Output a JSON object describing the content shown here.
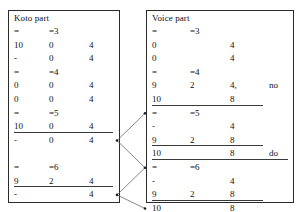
{
  "figure": {
    "left_panel": {
      "title": "Koto part",
      "rows": [
        {
          "cells": [
            "=",
            "=3",
            "",
            ""
          ],
          "underline": "none"
        },
        {
          "cells": [
            "10",
            "0",
            "4",
            ""
          ],
          "underline": "none"
        },
        {
          "cells": [
            "-",
            "0",
            "4",
            ""
          ],
          "underline": "none"
        },
        {
          "cells": [
            "=",
            "=4",
            "",
            ""
          ],
          "underline": "none"
        },
        {
          "cells": [
            "0",
            "0",
            "4",
            ""
          ],
          "underline": "none"
        },
        {
          "cells": [
            "0",
            "0",
            "4",
            ""
          ],
          "underline": "none"
        },
        {
          "cells": [
            "=",
            "=5",
            "",
            ""
          ],
          "underline": "none"
        },
        {
          "cells": [
            "10",
            "0",
            "4",
            ""
          ],
          "underline": "full"
        },
        {
          "cells": [
            "-",
            "0",
            "4",
            ""
          ],
          "underline": "none"
        },
        {
          "cells": [
            "",
            "",
            "",
            ""
          ],
          "underline": "none"
        },
        {
          "cells": [
            "=",
            "=6",
            "",
            ""
          ],
          "underline": "none"
        },
        {
          "cells": [
            "9",
            "2",
            "4",
            ""
          ],
          "underline": "full"
        },
        {
          "cells": [
            "-",
            "",
            "4",
            ""
          ],
          "underline": "none"
        },
        {
          "cells": [
            "",
            "",
            "",
            ""
          ],
          "underline": "none"
        },
        {
          "cells": [
            "=",
            "=7",
            "",
            ""
          ],
          "underline": "none"
        }
      ]
    },
    "right_panel": {
      "title": "Voice part",
      "rows": [
        {
          "cells": [
            "=",
            "=3",
            "",
            ""
          ],
          "underline": "none"
        },
        {
          "cells": [
            "0",
            "",
            "4",
            ""
          ],
          "underline": "none"
        },
        {
          "cells": [
            "0",
            "",
            "4",
            ""
          ],
          "underline": "none"
        },
        {
          "cells": [
            "=",
            "=4",
            "",
            ""
          ],
          "underline": "none"
        },
        {
          "cells": [
            "9",
            "2",
            "4,",
            "no"
          ],
          "underline": "none"
        },
        {
          "cells": [
            "10",
            "",
            "8",
            ""
          ],
          "underline": "short"
        },
        {
          "cells": [
            "=",
            "=5",
            "",
            ""
          ],
          "underline": "none"
        },
        {
          "cells": [
            "-",
            "",
            "4",
            ""
          ],
          "underline": "none"
        },
        {
          "cells": [
            "9",
            "2",
            "8",
            ""
          ],
          "underline": "short"
        },
        {
          "cells": [
            "10",
            "",
            "8",
            "do"
          ],
          "underline": "long"
        },
        {
          "cells": [
            "=",
            "=6",
            "",
            ""
          ],
          "underline": "none"
        },
        {
          "cells": [
            "-",
            "",
            "4",
            ""
          ],
          "underline": "none"
        },
        {
          "cells": [
            "9",
            "2",
            "8",
            ""
          ],
          "underline": "short"
        },
        {
          "cells": [
            "10",
            "",
            "8",
            ""
          ],
          "underline": "none"
        },
        {
          "cells": [
            "=",
            "=7",
            "",
            ""
          ],
          "underline": "none"
        }
      ]
    },
    "connectors": {
      "stroke_color": "#555555",
      "links": [
        {
          "from": "koto-row-8-end",
          "to": "voice-row-6-start"
        },
        {
          "from": "koto-row-8-end",
          "to": "voice-row-10-start"
        },
        {
          "from": "koto-row-12-end",
          "to": "voice-row-10-start"
        },
        {
          "from": "koto-row-12-end",
          "to": "voice-row-13-start"
        }
      ]
    }
  }
}
